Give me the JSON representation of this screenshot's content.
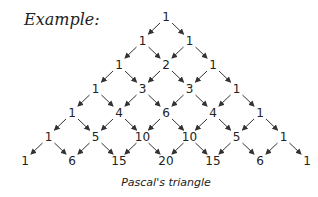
{
  "heading": "Example:",
  "caption": "Pascal's triangle",
  "triangle": {
    "rows": [
      [
        1
      ],
      [
        1,
        1
      ],
      [
        1,
        2,
        1
      ],
      [
        1,
        3,
        3,
        1
      ],
      [
        1,
        4,
        6,
        4,
        1
      ],
      [
        1,
        5,
        10,
        10,
        5,
        1
      ],
      [
        1,
        6,
        15,
        20,
        15,
        6,
        1
      ]
    ]
  },
  "colors": {
    "text": "#222222",
    "arrow": "#333333",
    "background": "#ffffff"
  }
}
